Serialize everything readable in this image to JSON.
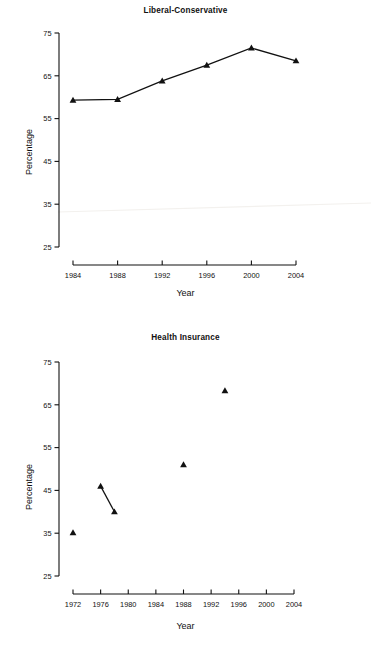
{
  "page": {
    "background": "#ffffff",
    "ink": "#111111",
    "width": 371,
    "height": 649
  },
  "charts": [
    {
      "id": "liberal-conservative",
      "title": "Liberal-Conservative",
      "xlabel": "Year",
      "ylabel": "Percentage",
      "type": "line",
      "marker": "triangle",
      "xticks": [
        1984,
        1988,
        1992,
        1996,
        2000,
        2004
      ],
      "xticklabels": [
        "1984",
        "1988",
        "1992",
        "1996",
        "2000",
        "2004"
      ],
      "yticks": [
        25,
        35,
        45,
        55,
        65,
        75
      ],
      "yticklabels": [
        "25",
        "35",
        "45",
        "55",
        "65",
        "75"
      ],
      "xlim": [
        1984,
        2004
      ],
      "ylim": [
        25,
        75
      ],
      "grid": false,
      "legend": false,
      "series": [
        {
          "name": "Liberal-Conservative",
          "x": [
            1984,
            1988,
            1992,
            1996,
            2000,
            2004
          ],
          "values": [
            59.3,
            59.5,
            63.8,
            67.5,
            71.5,
            68.5
          ]
        }
      ]
    },
    {
      "id": "health-insurance",
      "title": "Health Insurance",
      "xlabel": "Year",
      "ylabel": "Percentage",
      "type": "scatter",
      "marker": "triangle",
      "xticks": [
        1972,
        1976,
        1980,
        1984,
        1988,
        1992,
        1996,
        2000,
        2004
      ],
      "xticklabels": [
        "1972",
        "1976",
        "1980",
        "1984",
        "1988",
        "1992",
        "1996",
        "2000",
        "2004"
      ],
      "yticks": [
        25,
        35,
        45,
        55,
        65,
        75
      ],
      "yticklabels": [
        "25",
        "35",
        "45",
        "55",
        "65",
        "75"
      ],
      "xlim": [
        1972,
        2004
      ],
      "ylim": [
        25,
        75
      ],
      "grid": false,
      "legend": false,
      "series": [
        {
          "name": "Health Insurance",
          "x": [
            1972,
            1976,
            1978,
            1988,
            1994
          ],
          "values": [
            35.1,
            46.0,
            40.0,
            51.0,
            68.3
          ],
          "connected_pairs": [
            [
              1,
              2
            ]
          ]
        }
      ]
    }
  ],
  "chart_data": [
    {
      "type": "line",
      "title": "Liberal-Conservative",
      "xlabel": "Year",
      "ylabel": "Percentage",
      "x": [
        1984,
        1988,
        1992,
        1996,
        2000,
        2004
      ],
      "values": [
        59.3,
        59.5,
        63.8,
        67.5,
        71.5,
        68.5
      ],
      "categories": [
        "1984",
        "1988",
        "1992",
        "1996",
        "2000",
        "2004"
      ],
      "xlim": [
        1984,
        2004
      ],
      "ylim": [
        25,
        75
      ],
      "yticks": [
        25,
        35,
        45,
        55,
        65,
        75
      ],
      "grid": false,
      "legend": false
    },
    {
      "type": "scatter",
      "title": "Health Insurance",
      "xlabel": "Year",
      "ylabel": "Percentage",
      "x": [
        1972,
        1976,
        1978,
        1988,
        1994
      ],
      "values": [
        35.1,
        46.0,
        40.0,
        51.0,
        68.3
      ],
      "categories": [
        "1972",
        "1976",
        "1978",
        "1988",
        "1994"
      ],
      "xlim": [
        1972,
        2004
      ],
      "ylim": [
        25,
        75
      ],
      "yticks": [
        25,
        35,
        45,
        55,
        65,
        75
      ],
      "xticks": [
        1972,
        1976,
        1980,
        1984,
        1988,
        1992,
        1996,
        2000,
        2004
      ],
      "grid": false,
      "legend": false,
      "annotations": [
        "segment connecting 1976 and 1978 points"
      ]
    }
  ]
}
